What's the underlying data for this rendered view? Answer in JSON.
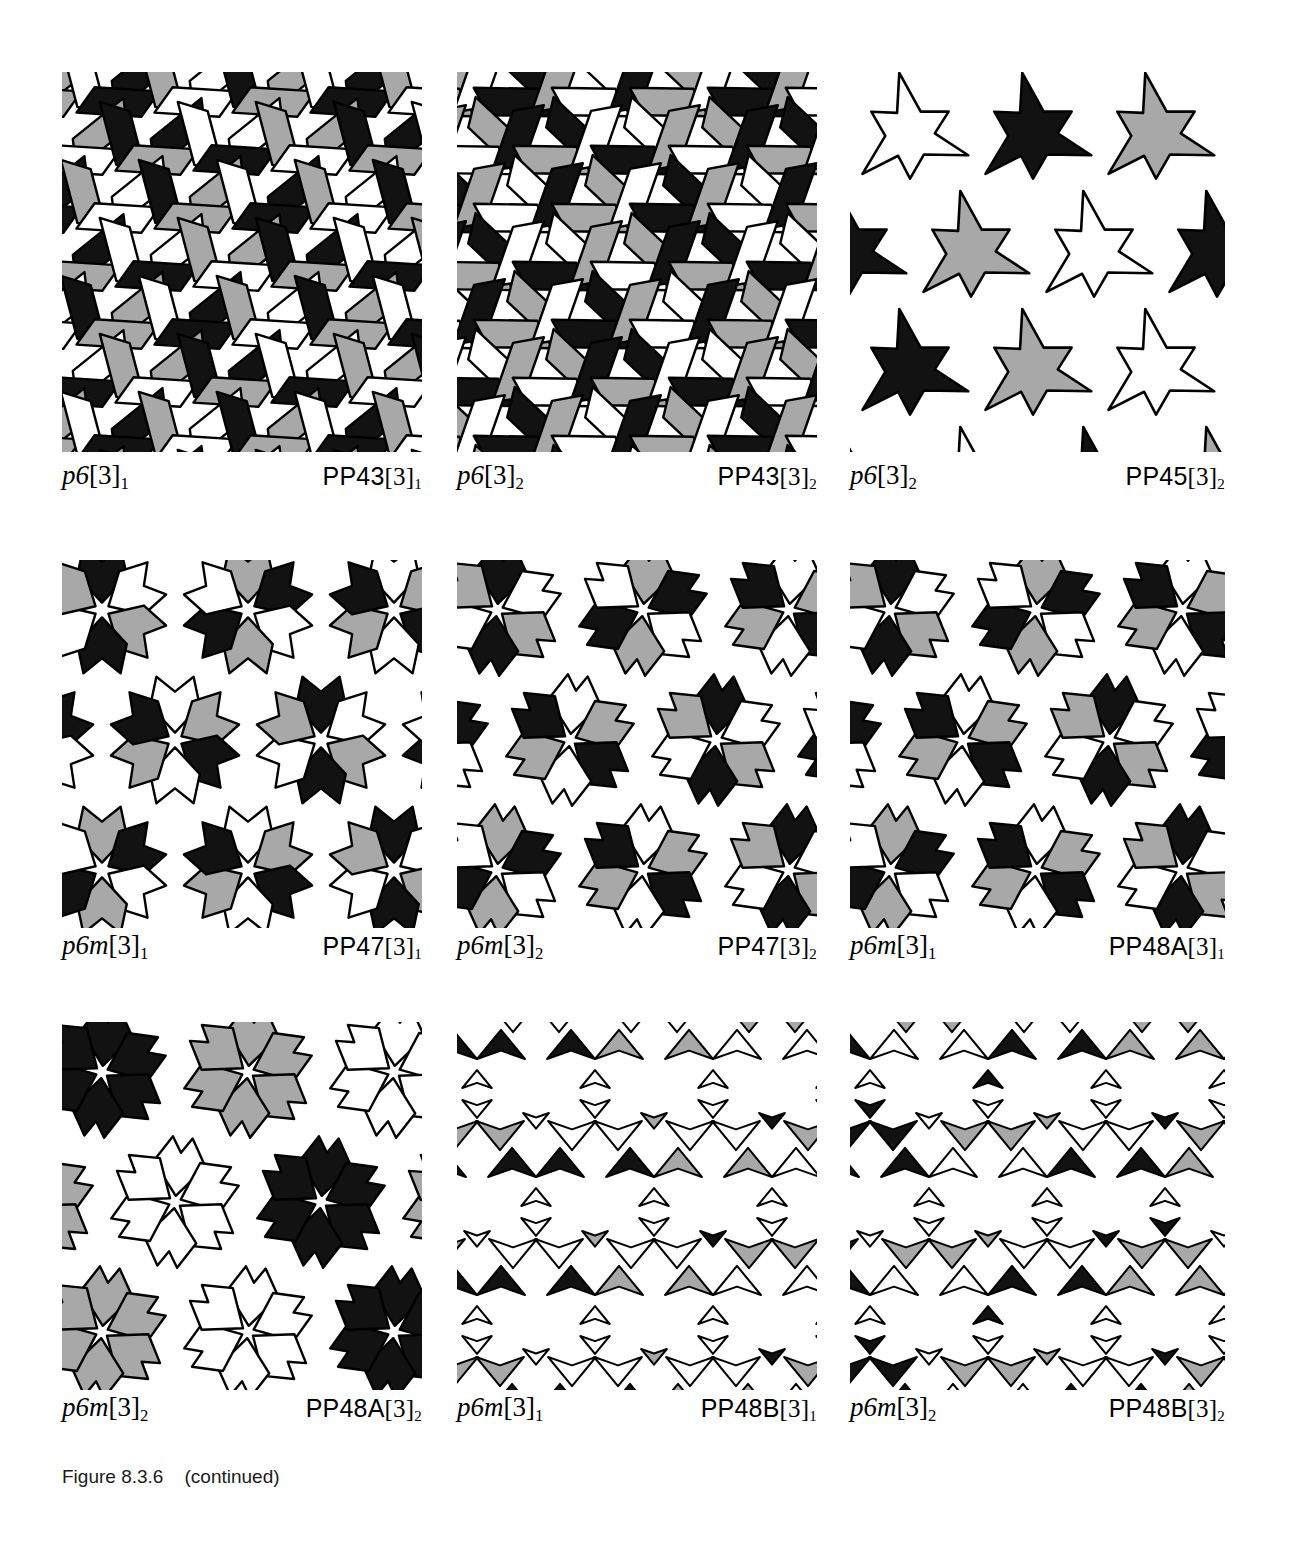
{
  "page": {
    "figure_caption": "Figure 8.3.6    (continued)",
    "background_color": "#ffffff",
    "ink_color": "#000000",
    "fill_colors": {
      "black": "#121212",
      "gray": "#a8a8a8",
      "white": "#ffffff",
      "outline": "#000000"
    }
  },
  "panels": [
    {
      "id": "pp43-3-1",
      "symmetry_group": "p6",
      "symmetry_bracket": "[3]",
      "symmetry_sub": "1",
      "pattern_label": "PP43",
      "pattern_bracket": "[3]",
      "pattern_sub": "1",
      "motif": "rhombus",
      "colors": [
        "black",
        "gray",
        "white"
      ],
      "lattice": "hexagonal",
      "row": 1,
      "column": 1
    },
    {
      "id": "pp43-3-2",
      "symmetry_group": "p6",
      "symmetry_bracket": "[3]",
      "symmetry_sub": "2",
      "pattern_label": "PP43",
      "pattern_bracket": "[3]",
      "pattern_sub": "2",
      "motif": "rhombus",
      "colors": [
        "black",
        "gray",
        "white"
      ],
      "lattice": "hexagonal",
      "row": 1,
      "column": 2
    },
    {
      "id": "pp45-3-2",
      "symmetry_group": "p6",
      "symmetry_bracket": "[3]",
      "symmetry_sub": "2",
      "pattern_label": "PP45",
      "pattern_bracket": "[3]",
      "pattern_sub": "2",
      "motif": "pinwheel-star",
      "colors": [
        "black",
        "gray",
        "white"
      ],
      "lattice": "hexagonal",
      "row": 1,
      "column": 3
    },
    {
      "id": "pp47-3-1",
      "symmetry_group": "p6m",
      "symmetry_bracket": "[3]",
      "symmetry_sub": "1",
      "pattern_label": "PP47",
      "pattern_bracket": "[3]",
      "pattern_sub": "1",
      "motif": "six-petal-rosette",
      "colors": [
        "black",
        "gray",
        "white"
      ],
      "lattice": "hexagonal",
      "row": 2,
      "column": 1
    },
    {
      "id": "pp47-3-2",
      "symmetry_group": "p6m",
      "symmetry_bracket": "[3]",
      "symmetry_sub": "2",
      "pattern_label": "PP47",
      "pattern_bracket": "[3]",
      "pattern_sub": "2",
      "motif": "six-petal-rosette",
      "colors": [
        "black",
        "gray",
        "white"
      ],
      "lattice": "hexagonal",
      "row": 2,
      "column": 2
    },
    {
      "id": "pp48a-3-1",
      "symmetry_group": "p6m",
      "symmetry_bracket": "[3]",
      "symmetry_sub": "1",
      "pattern_label": "PP48A",
      "pattern_bracket": "[3]",
      "pattern_sub": "1",
      "motif": "six-dart-rosette",
      "colors": [
        "black",
        "gray",
        "white"
      ],
      "lattice": "hexagonal",
      "row": 2,
      "column": 3
    },
    {
      "id": "pp48a-3-2",
      "symmetry_group": "p6m",
      "symmetry_bracket": "[3]",
      "symmetry_sub": "2",
      "pattern_label": "PP48A",
      "pattern_bracket": "[3]",
      "pattern_sub": "2",
      "motif": "six-dart-rosette-monochrome",
      "colors": [
        "black",
        "gray",
        "white"
      ],
      "lattice": "hexagonal",
      "row": 3,
      "column": 1
    },
    {
      "id": "pp48b-3-1",
      "symmetry_group": "p6m",
      "symmetry_bracket": "[3]",
      "symmetry_sub": "1",
      "pattern_label": "PP48B",
      "pattern_bracket": "[3]",
      "pattern_sub": "1",
      "motif": "small-concave-triangles",
      "colors": [
        "black",
        "gray",
        "white"
      ],
      "lattice": "hexagonal",
      "row": 3,
      "column": 2
    },
    {
      "id": "pp48b-3-2",
      "symmetry_group": "p6m",
      "symmetry_bracket": "[3]",
      "symmetry_sub": "2",
      "pattern_label": "PP48B",
      "pattern_bracket": "[3]",
      "pattern_sub": "2",
      "motif": "small-concave-triangles",
      "colors": [
        "black",
        "gray",
        "white"
      ],
      "lattice": "hexagonal",
      "row": 3,
      "column": 3
    }
  ]
}
